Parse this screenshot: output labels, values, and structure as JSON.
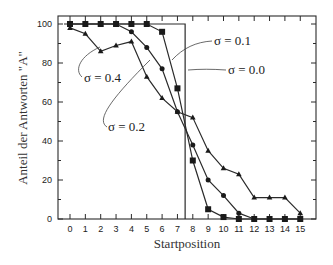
{
  "chart_data": {
    "type": "line",
    "title": "",
    "xlabel": "Startposition",
    "ylabel": "Anteil der Antworten \"A\"",
    "x": [
      0,
      1,
      2,
      3,
      4,
      5,
      6,
      7,
      8,
      9,
      10,
      11,
      12,
      13,
      14,
      15
    ],
    "xticks": [
      "0",
      "1",
      "2",
      "3",
      "4",
      "5",
      "6",
      "7",
      "8",
      "9",
      "10",
      "11",
      "12",
      "13",
      "14",
      "15"
    ],
    "yticks": [
      "0",
      "20",
      "40",
      "60",
      "80",
      "100"
    ],
    "ylim": [
      0,
      100
    ],
    "xlim": [
      -0.8,
      16.0
    ],
    "grid": false,
    "legend": "inline annotations",
    "series": [
      {
        "name": "σ = 0.0",
        "marker": "none",
        "step_at": 7.5,
        "values": [
          100,
          100,
          100,
          100,
          100,
          100,
          100,
          100,
          0,
          0,
          0,
          0,
          0,
          0,
          0,
          0
        ]
      },
      {
        "name": "σ = 0.1",
        "marker": "square",
        "values": [
          100,
          100,
          100,
          100,
          100,
          100,
          96,
          67,
          30,
          5,
          1,
          0,
          0,
          0,
          0,
          0
        ]
      },
      {
        "name": "σ = 0.2",
        "marker": "circle",
        "values": [
          100,
          100,
          100,
          100,
          96,
          88,
          77,
          55,
          38,
          20,
          12,
          3,
          0,
          0,
          0,
          0
        ]
      },
      {
        "name": "σ = 0.4",
        "marker": "triangle",
        "values": [
          98,
          95,
          86,
          89,
          91,
          73,
          62,
          55,
          52,
          35,
          26,
          23,
          11,
          11,
          11,
          3
        ]
      }
    ],
    "annotations": [
      {
        "text": "σ = 0.1",
        "x": 214,
        "y": 45
      },
      {
        "text": "σ = 0.0",
        "x": 228,
        "y": 74
      },
      {
        "text": "σ = 0.4",
        "x": 84,
        "y": 82
      },
      {
        "text": "σ = 0.2",
        "x": 108,
        "y": 131
      }
    ]
  }
}
